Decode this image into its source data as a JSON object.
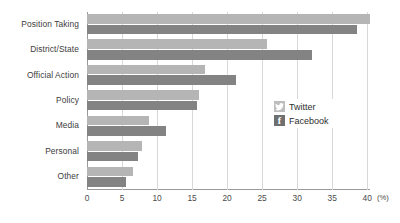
{
  "chart_data": {
    "type": "bar",
    "orientation": "horizontal",
    "title": "",
    "xlabel": "(%)",
    "ylabel": "",
    "xlim": [
      0,
      40
    ],
    "xticks": [
      0,
      5,
      10,
      15,
      20,
      25,
      30,
      35,
      40
    ],
    "xtick_labels": [
      "0",
      "5",
      "10",
      "15",
      "20",
      "25",
      "30",
      "35",
      "40"
    ],
    "unit": "(%)",
    "grid": true,
    "legend_position": "middle-right-inside",
    "categories": [
      "Position Taking",
      "District/State",
      "Official Action",
      "Policy",
      "Media",
      "Personal",
      "Other"
    ],
    "series": [
      {
        "name": "Twitter",
        "color": "#b5b5b5",
        "values": [
          40.4,
          25.7,
          16.8,
          16.0,
          8.9,
          7.8,
          6.6
        ]
      },
      {
        "name": "Facebook",
        "color": "#838383",
        "values": [
          38.6,
          32.1,
          21.2,
          15.7,
          11.3,
          7.3,
          5.6
        ]
      }
    ],
    "legend": [
      {
        "label": "Twitter",
        "icon": "twitter-bird-icon",
        "color": "#bdbdbd"
      },
      {
        "label": "Facebook",
        "icon": "facebook-f-icon",
        "color": "#6f6f6f"
      }
    ]
  }
}
